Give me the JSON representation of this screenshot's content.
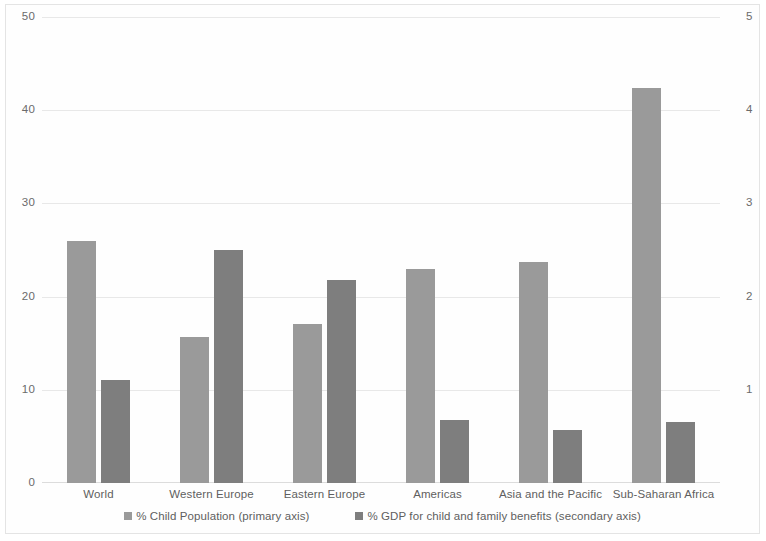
{
  "chart_data": {
    "type": "bar",
    "title": "",
    "subtitle": "",
    "xlabel": "",
    "ylabel": "",
    "grid": true,
    "legend_position": "bottom",
    "categories": [
      "World",
      "Western Europe",
      "Eastern Europe",
      "Americas",
      "Asia and the Pacific",
      "Sub-Saharan Africa"
    ],
    "series": [
      {
        "name": "% Child Population (primary axis)",
        "axis": "primary",
        "color": "#9a9a9a",
        "values": [
          26.0,
          15.7,
          17.1,
          23.0,
          23.7,
          42.4
        ]
      },
      {
        "name": "% GDP for child and family benefits (secondary axis)",
        "axis": "secondary",
        "color": "#7e7e7e",
        "values": [
          1.1,
          2.5,
          2.18,
          0.68,
          0.57,
          0.66
        ]
      }
    ],
    "primary_axis": {
      "ylim": [
        0,
        50
      ],
      "ticks": [
        0,
        10,
        20,
        30,
        40,
        50
      ],
      "tick_labels": [
        "0",
        "10",
        "20",
        "30",
        "40",
        "50"
      ]
    },
    "secondary_axis": {
      "ylim": [
        0,
        5
      ],
      "ticks": [
        1,
        2,
        3,
        4,
        5
      ],
      "tick_labels": [
        "1",
        "2",
        "3",
        "4",
        "5"
      ]
    }
  },
  "legend": {
    "items": [
      {
        "label": "% Child Population (primary axis)",
        "color": "#9a9a9a"
      },
      {
        "label": "% GDP for child and family benefits (secondary axis)",
        "color": "#7e7e7e"
      }
    ]
  }
}
